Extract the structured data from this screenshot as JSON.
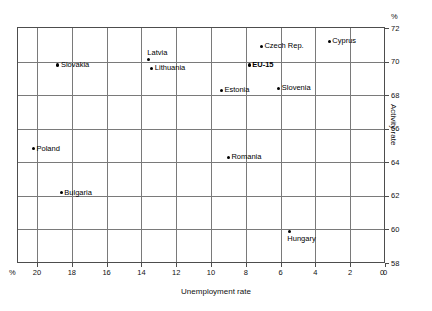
{
  "chart_data": {
    "type": "scatter",
    "title": "",
    "xlabel": "Unemployment rate",
    "ylabel": "Activity rate",
    "x_unit": "%",
    "y_unit": "%",
    "xlim": [
      20.7,
      0
    ],
    "ylim": [
      58,
      72
    ],
    "x_reversed": true,
    "x_ticks": [
      20,
      18,
      16,
      14,
      12,
      10,
      8,
      6,
      4,
      2,
      0
    ],
    "y_ticks": [
      58,
      60,
      62,
      64,
      66,
      68,
      70,
      72
    ],
    "grid": true,
    "legend": "none",
    "points": [
      {
        "label": "Slovakia",
        "x": 18.8,
        "y": 69.8,
        "label_pos": "right",
        "bold": false
      },
      {
        "label": "Latvia",
        "x": 13.6,
        "y": 70.1,
        "label_pos": "above",
        "bold": false
      },
      {
        "label": "Lithuania",
        "x": 13.4,
        "y": 69.6,
        "label_pos": "right",
        "bold": false
      },
      {
        "label": "Czech Rep.",
        "x": 7.1,
        "y": 70.9,
        "label_pos": "right",
        "bold": false
      },
      {
        "label": "Cyprus",
        "x": 3.2,
        "y": 71.2,
        "label_pos": "right",
        "bold": false
      },
      {
        "label": "EU-15",
        "x": 7.8,
        "y": 69.8,
        "label_pos": "right",
        "bold": true
      },
      {
        "label": "Estonia",
        "x": 9.4,
        "y": 68.3,
        "label_pos": "right",
        "bold": false
      },
      {
        "label": "Slovenia",
        "x": 6.1,
        "y": 68.4,
        "label_pos": "right",
        "bold": false
      },
      {
        "label": "Poland",
        "x": 20.2,
        "y": 64.8,
        "label_pos": "right",
        "bold": false
      },
      {
        "label": "Romania",
        "x": 9.0,
        "y": 64.3,
        "label_pos": "right",
        "bold": false
      },
      {
        "label": "Bulgaria",
        "x": 18.6,
        "y": 62.2,
        "label_pos": "right",
        "bold": false
      },
      {
        "label": "Hungary",
        "x": 5.5,
        "y": 59.9,
        "label_pos": "below",
        "bold": false
      }
    ]
  },
  "axes": {
    "x_title": "Unemployment rate",
    "y_title": "Activity rate",
    "x_percent_symbol": "%",
    "y_percent_symbol": "%",
    "x_zero_corner": "0",
    "x_tick_labels": [
      "20",
      "18",
      "16",
      "14",
      "12",
      "10",
      "8",
      "6",
      "4",
      "2",
      "0"
    ],
    "y_tick_labels": [
      "58",
      "60",
      "62",
      "64",
      "66",
      "68",
      "70",
      "72"
    ]
  },
  "colors": {
    "marker": "#000000",
    "grid": "#7a7a7a",
    "frame": "#4d4d4d",
    "background": "#ffffff",
    "text": "#111111"
  }
}
